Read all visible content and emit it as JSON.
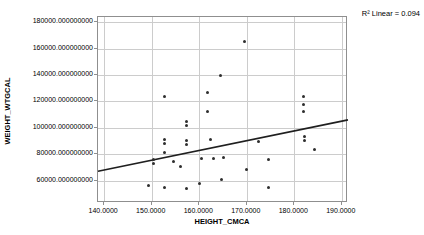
{
  "chart_data": {
    "type": "scatter",
    "title": "",
    "xlabel": "HEIGHT_CMCA",
    "ylabel": "WEIGHT_WTGCAL",
    "annotation": "R² Linear = 0.094",
    "grid": true,
    "legend": "none",
    "xlim": [
      138.7,
      191.3
    ],
    "ylim": [
      43000,
      184000
    ],
    "x_ticks": [
      140,
      150,
      160,
      170,
      180,
      190
    ],
    "x_tick_labels": [
      "140.0000",
      "150.0000",
      "160.0000",
      "170.0000",
      "180.0000",
      "190.0000"
    ],
    "y_ticks": [
      180000,
      160000,
      140000,
      120000,
      100000,
      80000,
      60000
    ],
    "y_tick_labels": [
      "180000.000000000",
      "160000.000000000",
      "140000.000000000",
      "120000.000000000",
      "100000.000000000",
      "80000.000000000",
      "60000.000000000"
    ],
    "points": [
      [
        169.5,
        165500
      ],
      [
        164.5,
        139500
      ],
      [
        161.8,
        126500
      ],
      [
        152.6,
        123500
      ],
      [
        181.9,
        124000
      ],
      [
        181.9,
        118000
      ],
      [
        181.9,
        112000
      ],
      [
        161.8,
        112000
      ],
      [
        157.4,
        105000
      ],
      [
        157.4,
        102000
      ],
      [
        152.6,
        91000
      ],
      [
        152.6,
        88000
      ],
      [
        157.4,
        90500
      ],
      [
        157.4,
        87000
      ],
      [
        162.4,
        91000
      ],
      [
        172.4,
        90000
      ],
      [
        182.2,
        93500
      ],
      [
        182.2,
        90500
      ],
      [
        184.3,
        83500
      ],
      [
        152.6,
        81000
      ],
      [
        150.4,
        76000
      ],
      [
        150.4,
        73000
      ],
      [
        154.5,
        74500
      ],
      [
        160.4,
        77000
      ],
      [
        163.0,
        77000
      ],
      [
        165.1,
        77500
      ],
      [
        174.5,
        76000
      ],
      [
        156.0,
        70500
      ],
      [
        169.9,
        68500
      ],
      [
        164.7,
        61000
      ],
      [
        160.0,
        58000
      ],
      [
        149.4,
        56500
      ],
      [
        152.6,
        55000
      ],
      [
        157.4,
        54000
      ],
      [
        174.5,
        54500
      ]
    ],
    "regression_line": {
      "x1": 138.7,
      "y1": 67000,
      "x2": 191.3,
      "y2": 106000
    },
    "colors": {
      "point": "#2e2e2e",
      "regression_line": "#1f1f1f",
      "gridline": "#cccccc",
      "frame": "#8f8f8f",
      "text": "#000000",
      "background": "#ffffff"
    }
  }
}
